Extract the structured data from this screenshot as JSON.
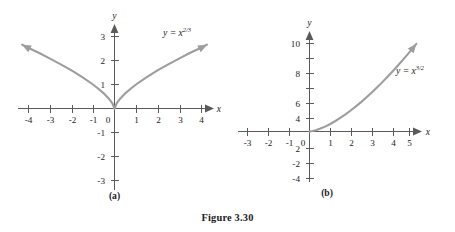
{
  "figure": {
    "caption": "Figure 3.30"
  },
  "chart_data": [
    {
      "type": "line",
      "panel_label": "(a)",
      "title": "",
      "equation_label": "y = x",
      "equation_exponent": "2/3",
      "function": "y = x^(2/3)",
      "xlabel": "x",
      "ylabel": "y",
      "xlim": [
        -4.6,
        4.6
      ],
      "ylim": [
        -3.4,
        3.4
      ],
      "xticks": [
        -4,
        -3,
        -2,
        -1,
        0,
        1,
        2,
        3,
        4
      ],
      "yticks": [
        -3,
        -2,
        -1,
        1,
        2,
        3
      ],
      "xtick_labels": [
        "-4",
        "-3",
        "-2",
        "-1",
        "0",
        "1",
        "2",
        "3",
        "4"
      ],
      "ytick_labels": [
        "-3",
        "-2",
        "-1",
        "1",
        "2",
        "3"
      ],
      "origin_label": "0",
      "grid": false,
      "legend": "none",
      "arrows": [
        "left-end",
        "right-end"
      ],
      "x": [
        -4.3,
        -4.0,
        -3.5,
        -3.0,
        -2.5,
        -2.0,
        -1.5,
        -1.0,
        -0.75,
        -0.5,
        -0.25,
        -0.1,
        0,
        0.1,
        0.25,
        0.5,
        0.75,
        1.0,
        1.5,
        2.0,
        2.5,
        3.0,
        3.5,
        4.0,
        4.3
      ],
      "y": [
        2.66,
        2.52,
        2.31,
        2.08,
        1.84,
        1.59,
        1.31,
        1.0,
        0.825,
        0.63,
        0.397,
        0.215,
        0,
        0.215,
        0.397,
        0.63,
        0.825,
        1.0,
        1.31,
        1.59,
        1.84,
        2.08,
        2.31,
        2.52,
        2.66
      ]
    },
    {
      "type": "line",
      "panel_label": "(b)",
      "title": "",
      "equation_label": "y = x",
      "equation_exponent": "3/2",
      "function": "y = x^(3/2)",
      "xlabel": "x",
      "ylabel": "y",
      "xlim": [
        -3.5,
        5.6
      ],
      "ylim": [
        -5.0,
        11.5
      ],
      "xticks": [
        -3,
        -2,
        -1,
        0,
        1,
        2,
        3,
        4,
        5
      ],
      "yticks": [
        -4,
        -2,
        2,
        4,
        6,
        8,
        10
      ],
      "xtick_labels": [
        "-3",
        "-2",
        "-1",
        "0",
        "1",
        "2",
        "3",
        "4",
        "5"
      ],
      "ytick_labels": [
        "-4",
        "-2",
        "2",
        "4",
        "6",
        "8",
        "10"
      ],
      "origin_label": "0",
      "grid": false,
      "legend": "none",
      "arrows": [
        "right-end"
      ],
      "x": [
        0,
        0.15,
        0.3,
        0.5,
        0.75,
        1.0,
        1.25,
        1.5,
        1.75,
        2.0,
        2.25,
        2.5,
        2.75,
        3.0,
        3.25,
        3.5,
        3.75,
        4.0,
        4.25,
        4.5,
        4.75,
        5.0,
        5.15
      ],
      "y": [
        0,
        0.058,
        0.164,
        0.354,
        0.65,
        1.0,
        1.4,
        1.84,
        2.32,
        2.83,
        3.38,
        3.95,
        4.56,
        5.2,
        5.86,
        6.55,
        7.26,
        8.0,
        8.76,
        9.55,
        10.35,
        11.18,
        11.69
      ]
    }
  ],
  "colors": {
    "curve": "#9d9d9d",
    "axis": "#5a5a5a",
    "text": "#1c1c1c",
    "background": "#ffffff"
  }
}
